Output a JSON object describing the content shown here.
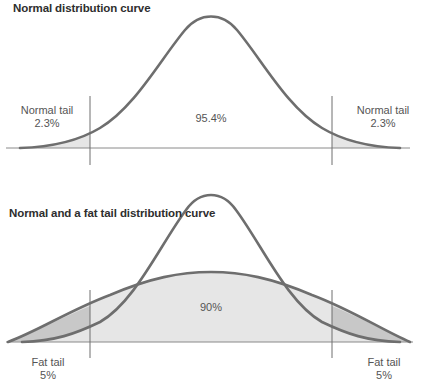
{
  "top_chart": {
    "title": "Normal distribution curve",
    "left_tail": {
      "label": "Normal tail",
      "value": "2.3%"
    },
    "center": {
      "value": "95.4%"
    },
    "right_tail": {
      "label": "Normal tail",
      "value": "2.3%"
    }
  },
  "bottom_chart": {
    "title": "Normal and a fat tail distribution curve",
    "left_tail": {
      "label": "Fat tail",
      "value": "5%"
    },
    "center": {
      "value": "90%"
    },
    "right_tail": {
      "label": "Fat tail",
      "value": "5%"
    }
  },
  "colors": {
    "curve": "#6e6e6e",
    "axis": "#8a8a8a",
    "light_fill": "#e6e6e6",
    "dark_fill": "#c8c8c8"
  }
}
